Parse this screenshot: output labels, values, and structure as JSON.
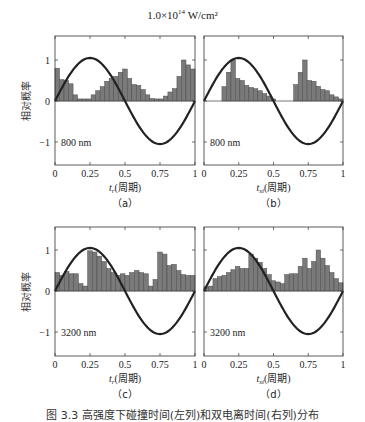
{
  "figure": {
    "title_main": "1.0×10",
    "title_exp": "14",
    "title_unit": " W/cm²",
    "ylabel": "相对概率",
    "caption": "图 3.3  高强度下碰撞时间(左列)和双电离时间(右列)分布"
  },
  "chart_data": [
    {
      "type": "bar",
      "panel": "(a)",
      "annotation": "800 nm",
      "xlabel": "t_r(周期)",
      "ylabel": "相对概率",
      "xlim": [
        0,
        1
      ],
      "ylim": [
        -1.5,
        1.5
      ],
      "xticks": [
        "0",
        "0.25",
        "0.5",
        "0.75",
        "1"
      ],
      "yticks": [
        "-1",
        "0",
        "1"
      ],
      "bin_width": 0.0333,
      "values": [
        0.8,
        0.52,
        0.5,
        0.42,
        0.15,
        0.05,
        0.05,
        0.05,
        0.15,
        0.25,
        0.35,
        0.48,
        0.55,
        0.6,
        0.7,
        0.78,
        0.55,
        0.4,
        0.38,
        0.28,
        0.15,
        0.06,
        0.05,
        0.05,
        0.12,
        0.22,
        0.3,
        0.6,
        1.0,
        0.88,
        0.78
      ],
      "overlay": "sin(2πt) field curve"
    },
    {
      "type": "bar",
      "panel": "(b)",
      "annotation": "800 nm",
      "xlabel": "t_si(周期)",
      "ylabel": "",
      "xlim": [
        0,
        1
      ],
      "ylim": [
        -1.5,
        1.5
      ],
      "xticks": [
        "0",
        "0.25",
        "0.5",
        "0.75",
        "1"
      ],
      "yticks": [
        "-1",
        "0",
        "1"
      ],
      "bin_width": 0.0333,
      "values": [
        0,
        0,
        0,
        0,
        0.35,
        0.7,
        1.0,
        0.55,
        0.5,
        0.38,
        0.33,
        0.3,
        0.25,
        0.18,
        0.12,
        0.05,
        0,
        0,
        0,
        0,
        0.4,
        0.7,
        1.0,
        0.5,
        0.48,
        0.36,
        0.28,
        0.25,
        0.15,
        0.1,
        0.05
      ],
      "overlay": "sin(2πt) field curve"
    },
    {
      "type": "bar",
      "panel": "(c)",
      "annotation": "3200 nm",
      "xlabel": "t_r(周期)",
      "ylabel": "相对概率",
      "xlim": [
        0,
        1
      ],
      "ylim": [
        -1.5,
        1.5
      ],
      "xticks": [
        "0",
        "0.25",
        "0.5",
        "0.75",
        "1"
      ],
      "yticks": [
        "-1",
        "0",
        "1"
      ],
      "bin_width": 0.0333,
      "values": [
        0.45,
        0.38,
        0.48,
        0.42,
        0.42,
        0.18,
        0.12,
        0.98,
        0.95,
        0.85,
        0.72,
        0.55,
        0.45,
        0.38,
        0.42,
        0.38,
        0.45,
        0.5,
        0.45,
        0.42,
        0.12,
        0.28,
        0.95,
        0.9,
        0.62,
        0.65,
        0.5,
        0.4,
        0.38,
        0.38
      ],
      "overlay": "sin(2πt) field curve"
    },
    {
      "type": "bar",
      "panel": "(d)",
      "annotation": "3200 nm",
      "xlabel": "t_si(周期)",
      "ylabel": "",
      "xlim": [
        0,
        1
      ],
      "ylim": [
        -1.5,
        1.5
      ],
      "xticks": [
        "0",
        "0.25",
        "0.5",
        "0.75",
        "1"
      ],
      "yticks": [
        "-1",
        "0",
        "1"
      ],
      "bin_width": 0.0333,
      "values": [
        0.1,
        0.12,
        0.3,
        0.35,
        0.38,
        0.45,
        0.52,
        0.6,
        0.55,
        0.55,
        0.9,
        0.8,
        0.7,
        0.55,
        0.4,
        0.25,
        0.22,
        0.18,
        0.4,
        0.42,
        0.42,
        0.6,
        0.8,
        0.55,
        0.72,
        1.0,
        0.8,
        0.62,
        0.45,
        0.3,
        0.2
      ],
      "overlay": "sin(2πt) field curve"
    }
  ]
}
